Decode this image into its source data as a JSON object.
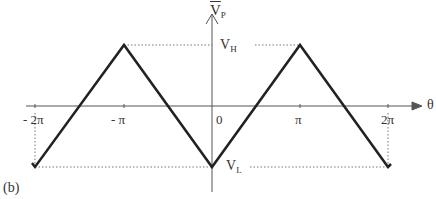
{
  "figure": {
    "panel_label": "(b)",
    "y_axis_label": "V",
    "y_axis_sub": "P",
    "x_axis_label": "θ",
    "level_high": {
      "main": "V",
      "sub": "H"
    },
    "level_low": {
      "main": "V",
      "sub": "L"
    },
    "x_ticks": [
      "- 2π",
      "- π",
      "0",
      "π",
      "2π"
    ],
    "waveform": "triangle",
    "points": [
      {
        "theta": "-2π",
        "value": "V_L"
      },
      {
        "theta": "-π",
        "value": "V_H"
      },
      {
        "theta": "0",
        "value": "V_L"
      },
      {
        "theta": "π",
        "value": "V_H"
      },
      {
        "theta": "2π",
        "value": "V_L"
      }
    ],
    "line_color": "#222222",
    "axis_color": "#555555"
  }
}
